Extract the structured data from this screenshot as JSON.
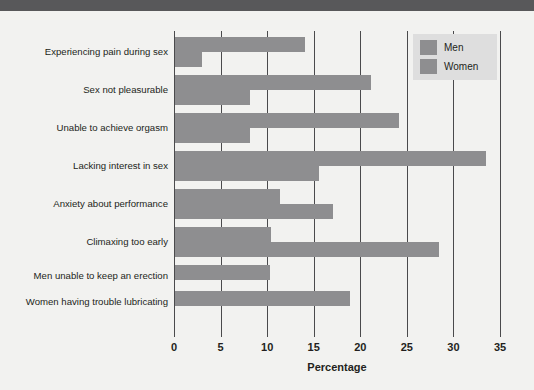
{
  "chart_data": {
    "type": "bar",
    "orientation": "horizontal",
    "title": "",
    "xlabel": "Percentage",
    "ylabel": "",
    "xlim": [
      0,
      35
    ],
    "xticks": [
      0,
      5,
      10,
      15,
      20,
      25,
      30,
      35
    ],
    "grid": true,
    "legend_position": "top-right",
    "categories": [
      "Experiencing pain during sex",
      "Sex not pleasurable",
      "Unable to achieve orgasm",
      "Lacking interest in sex",
      "Anxiety about performance",
      "Climaxing too early",
      "Men unable to keep an erection",
      "Women having trouble lubricating"
    ],
    "series": [
      {
        "name": "Men",
        "color": "#8e8e90",
        "values": [
          14.0,
          21.0,
          24.0,
          33.4,
          11.3,
          10.3,
          10.2,
          null
        ]
      },
      {
        "name": "Women",
        "color": "#8e8e90",
        "values": [
          2.9,
          8.0,
          8.0,
          15.5,
          17.0,
          28.3,
          null,
          18.8
        ]
      }
    ]
  },
  "legend": {
    "items": [
      {
        "label": "Men",
        "color": "#8e8e90"
      },
      {
        "label": "Women",
        "color": "#8e8e90"
      }
    ]
  },
  "colors": {
    "bar": "#8e8e90",
    "axis": "#4a4a4c",
    "text": "#231f20",
    "page": "#f2f2f0",
    "legend_bg": "#dedede",
    "top_band": "#58585a"
  }
}
